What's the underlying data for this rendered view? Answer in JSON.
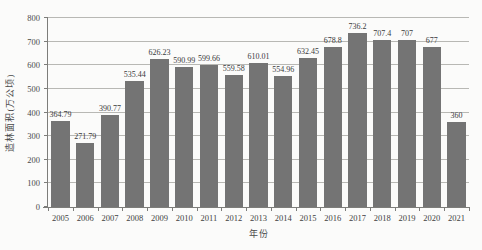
{
  "chart_data": {
    "type": "bar",
    "title": "",
    "xlabel": "年份",
    "ylabel": "造林面积(万公顷)",
    "categories": [
      "2005",
      "2006",
      "2007",
      "2008",
      "2009",
      "2010",
      "2011",
      "2012",
      "2013",
      "2014",
      "2015",
      "2016",
      "2017",
      "2018",
      "2019",
      "2020",
      "2021"
    ],
    "values": [
      364.79,
      271.79,
      390.77,
      535.44,
      626.23,
      590.99,
      599.66,
      559.58,
      610.01,
      554.96,
      632.45,
      678.8,
      736.2,
      707.4,
      707,
      677,
      360
    ],
    "value_labels": [
      "364.79",
      "271.79",
      "390.77",
      "535.44",
      "626.23",
      "590.99",
      "599.66",
      "559.58",
      "610.01",
      "554.96",
      "632.45",
      "678.8",
      "736.2",
      "707.4",
      "707",
      "677",
      "360"
    ],
    "ylim": [
      0,
      800
    ],
    "ytick_step": 100,
    "grid": true,
    "legend": null,
    "colors": {
      "bar": "#747474",
      "gridline": "#b8b8b4",
      "axis": "#7d7d7a",
      "text": "#3f3f3f",
      "background": "#fbfbfa"
    }
  }
}
